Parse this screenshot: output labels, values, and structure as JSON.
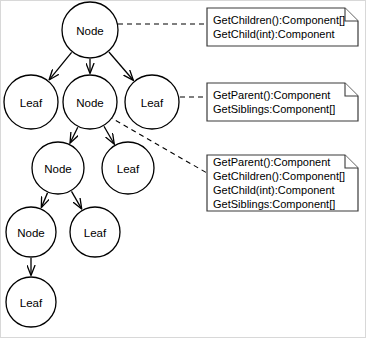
{
  "diagram": {
    "colors": {
      "stroke": "#000000",
      "note_stroke": "#3a3a3a",
      "background": "#ffffff",
      "frame": "#d8d8d8"
    },
    "nodes": [
      {
        "id": "n-root",
        "label": "Node",
        "cx": 90,
        "cy": 30,
        "r": 28
      },
      {
        "id": "n-leaf-a",
        "label": "Leaf",
        "cx": 31,
        "cy": 102,
        "r": 27
      },
      {
        "id": "n-mid",
        "label": "Node",
        "cx": 90,
        "cy": 102,
        "r": 27
      },
      {
        "id": "n-leaf-b",
        "label": "Leaf",
        "cx": 152,
        "cy": 102,
        "r": 27
      },
      {
        "id": "n-sub",
        "label": "Node",
        "cx": 58,
        "cy": 168,
        "r": 26
      },
      {
        "id": "n-leaf-c",
        "label": "Leaf",
        "cx": 128,
        "cy": 168,
        "r": 26
      },
      {
        "id": "n-deep",
        "label": "Node",
        "cx": 31,
        "cy": 232,
        "r": 25
      },
      {
        "id": "n-leaf-d",
        "label": "Leaf",
        "cx": 95,
        "cy": 232,
        "r": 25
      },
      {
        "id": "n-leaf-e",
        "label": "Leaf",
        "cx": 31,
        "cy": 302,
        "r": 25
      }
    ],
    "edges": [
      {
        "from": "n-root",
        "to": "n-leaf-a"
      },
      {
        "from": "n-root",
        "to": "n-mid"
      },
      {
        "from": "n-root",
        "to": "n-leaf-b"
      },
      {
        "from": "n-mid",
        "to": "n-sub"
      },
      {
        "from": "n-mid",
        "to": "n-leaf-c"
      },
      {
        "from": "n-sub",
        "to": "n-deep"
      },
      {
        "from": "n-sub",
        "to": "n-leaf-d"
      },
      {
        "from": "n-deep",
        "to": "n-leaf-e"
      }
    ],
    "notes": [
      {
        "id": "note-root",
        "x": 207,
        "y": 8,
        "width": 151,
        "height": 38,
        "fold": 13,
        "lines": [
          "GetChildren():Component[]",
          "GetChild(int):Component"
        ]
      },
      {
        "id": "note-leaf",
        "x": 207,
        "y": 83,
        "width": 151,
        "height": 38,
        "fold": 13,
        "lines": [
          "GetParent():Component",
          "GetSiblings:Component[]"
        ]
      },
      {
        "id": "note-mid",
        "x": 207,
        "y": 155,
        "width": 151,
        "height": 56,
        "fold": 13,
        "lines": [
          "GetParent():Component",
          "GetChildren():Component[]",
          "GetChild(int):Component",
          "GetSiblings:Component[]"
        ]
      }
    ],
    "note_links": [
      {
        "id": "link-root",
        "x1": 118,
        "y1": 24,
        "x2": 207,
        "y2": 24
      },
      {
        "id": "link-leaf",
        "x1": 180,
        "y1": 97,
        "x2": 207,
        "y2": 97
      },
      {
        "id": "link-mid",
        "x1": 108,
        "y1": 116,
        "x2": 207,
        "y2": 173
      }
    ]
  }
}
